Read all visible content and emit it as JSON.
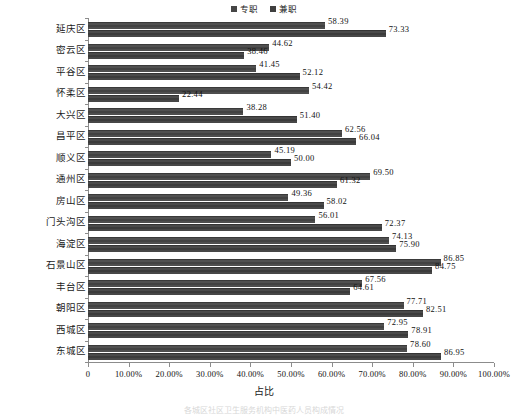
{
  "chart_data": {
    "type": "bar",
    "orientation": "horizontal",
    "title": "",
    "xlabel": "占比",
    "ylabel": "",
    "xlim": [
      0,
      100
    ],
    "grid": false,
    "legend_position": "top-center",
    "xticks": [
      "0",
      "10.00%",
      "20.00%",
      "30.00%",
      "40.00%",
      "50.00%",
      "60.00%",
      "70.00%",
      "80.00%",
      "90.00%",
      "100.00%"
    ],
    "xtick_values": [
      0,
      10,
      20,
      30,
      40,
      50,
      60,
      70,
      80,
      90,
      100
    ],
    "categories": [
      "延庆区",
      "密云区",
      "平谷区",
      "怀柔区",
      "大兴区",
      "昌平区",
      "顺义区",
      "通州区",
      "房山区",
      "门头沟区",
      "海淀区",
      "石景山区",
      "丰台区",
      "朝阳区",
      "西城区",
      "东城区"
    ],
    "series": [
      {
        "name": "专职",
        "color": "#464646",
        "values": [
          58.39,
          44.62,
          41.45,
          54.42,
          38.28,
          62.56,
          45.19,
          69.5,
          49.36,
          56.01,
          74.13,
          86.85,
          67.56,
          77.71,
          72.95,
          78.6
        ],
        "labels": [
          "58.39",
          "44.62",
          "41.45",
          "54.42",
          "38.28",
          "62.56",
          "45.19",
          "69.50",
          "49.36",
          "56.01",
          "74.13",
          "86.85",
          "67.56",
          "77.71",
          "72.95",
          "78.60"
        ]
      },
      {
        "name": "兼职",
        "color": "#3f3f3f",
        "values": [
          73.33,
          38.46,
          52.12,
          22.44,
          51.4,
          66.04,
          50.0,
          61.32,
          58.02,
          72.37,
          75.9,
          84.75,
          64.61,
          82.51,
          78.91,
          86.95
        ],
        "labels": [
          "73.33",
          "38.46",
          "52.12",
          "22.44",
          "51.40",
          "66.04",
          "50.00",
          "61.32",
          "58.02",
          "72.37",
          "75.90",
          "84.75",
          "64.61",
          "82.51",
          "78.91",
          "86.95"
        ]
      }
    ]
  },
  "legend": {
    "entries": [
      {
        "label": "专职",
        "color": "#464646"
      },
      {
        "label": "兼职",
        "color": "#3f3f3f"
      }
    ]
  },
  "axis": {
    "x_title": "占比"
  },
  "caption": {
    "text": "各城区社区卫生服务机构中医药人员构成情况"
  }
}
